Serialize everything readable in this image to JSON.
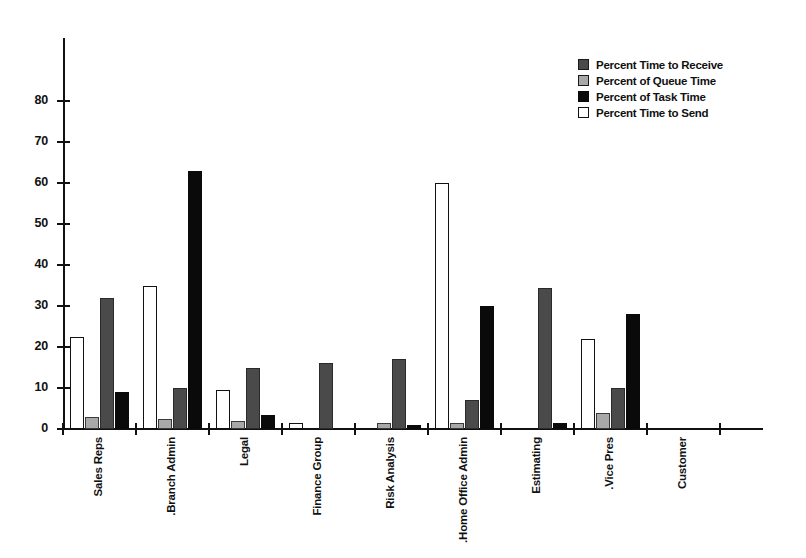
{
  "chart_data": {
    "type": "bar",
    "title": "",
    "subtitle": "",
    "xlabel": "",
    "ylabel": "",
    "ylim": [
      0,
      90
    ],
    "yticks": [
      0,
      10,
      20,
      30,
      40,
      50,
      60,
      70,
      80
    ],
    "ytick_labels": [
      "0",
      "10",
      "20",
      "30",
      "40",
      "50",
      "60",
      "70",
      "80"
    ],
    "grid": false,
    "legend_position": "top-right",
    "bar_order": [
      "Percent Time to Send",
      "Percent of Queue Time",
      "Percent Time to Receive",
      "Percent of Task Time"
    ],
    "categories": [
      "Sales Reps",
      "Branch Admin.",
      "Legal",
      "Finance Group",
      "Risk Analysis",
      "Home Office Admin.",
      "Estimating",
      "Vice Pres.",
      "Customer"
    ],
    "series": [
      {
        "name": "Percent Time to Receive",
        "color": "#4a4a4a",
        "values": [
          32,
          10,
          15,
          16,
          17,
          7,
          34.5,
          10,
          0
        ]
      },
      {
        "name": "Percent of Queue Time",
        "color": "#a8a8a8",
        "values": [
          3,
          2.5,
          2,
          0,
          1.5,
          1.5,
          0,
          4,
          0
        ]
      },
      {
        "name": "Percent of Task Time",
        "color": "#0a0a0a",
        "values": [
          9,
          63,
          3.5,
          0,
          1,
          30,
          1.5,
          28,
          0
        ]
      },
      {
        "name": "Percent Time to Send",
        "color": "#ffffff",
        "values": [
          22.5,
          35,
          9.5,
          1.5,
          0,
          60,
          0,
          22,
          0
        ]
      }
    ]
  },
  "legend": {
    "items": [
      {
        "label": "Percent Time to Receive",
        "swatch": "series-receive"
      },
      {
        "label": "Percent of Queue Time",
        "swatch": "series-queue"
      },
      {
        "label": "Percent of Task Time",
        "swatch": "series-task"
      },
      {
        "label": "Percent Time to Send",
        "swatch": "series-send"
      }
    ]
  }
}
